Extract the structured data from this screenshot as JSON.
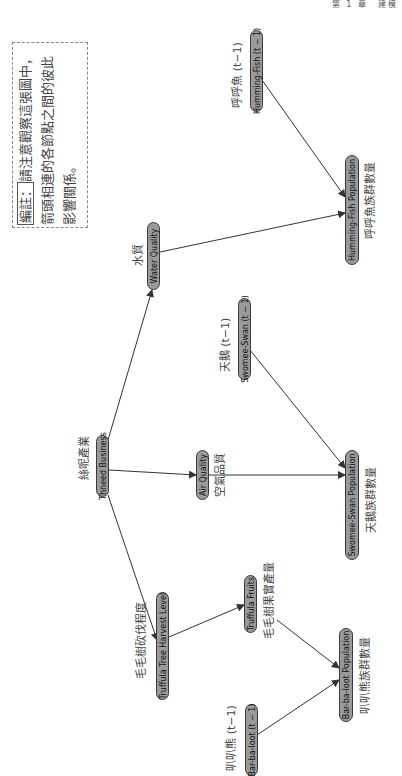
{
  "page_header": "第 1 章　建模",
  "note": {
    "tag": "編註：",
    "text": "請注意觀察這張圖中，箭頭相連的各節點之間的彼此影響關係。"
  },
  "nodes": {
    "humming_fish_prev": {
      "en": "Humming-Fish (t − 1)",
      "cn": "呼呼魚 (t−1)"
    },
    "humming_fish_pop": {
      "en": "Humming-Fish Population",
      "cn": "呼呼魚族群數量"
    },
    "water_quality": {
      "en": "Water Quality",
      "cn": "水質"
    },
    "swomee_swan_prev": {
      "en": "Swomee-Swan (t − 1)",
      "cn": "天鵝 (t−1)"
    },
    "thneed_business": {
      "en": "Thneed Business",
      "cn": "絲呢產業"
    },
    "air_quality": {
      "en": "Air Quality",
      "cn": "空氣品質"
    },
    "swomee_swan_pop": {
      "en": "Swomee-Swan Population",
      "cn": "天鵝族群數量"
    },
    "truffula_harvest": {
      "en": "Truffula Tree Harvest Level",
      "cn": "毛毛樹砍伐程度"
    },
    "truffula_fruits": {
      "en": "Truffula Fruits",
      "cn": "毛毛樹果實產量"
    },
    "barbaloot_pop": {
      "en": "Bar-ba-loot Population",
      "cn": "叭叭熊族群數量"
    },
    "barbaloot_prev": {
      "en": "Bar-ba-loot (t − 1)",
      "cn": "叭叭熊 (t−1)"
    }
  },
  "edges": [
    {
      "from": "thneed_business",
      "to": "water_quality"
    },
    {
      "from": "thneed_business",
      "to": "air_quality"
    },
    {
      "from": "thneed_business",
      "to": "truffula_harvest"
    },
    {
      "from": "water_quality",
      "to": "humming_fish_pop"
    },
    {
      "from": "humming_fish_prev",
      "to": "humming_fish_pop"
    },
    {
      "from": "air_quality",
      "to": "swomee_swan_pop"
    },
    {
      "from": "swomee_swan_prev",
      "to": "swomee_swan_pop"
    },
    {
      "from": "truffula_harvest",
      "to": "truffula_fruits"
    },
    {
      "from": "truffula_fruits",
      "to": "barbaloot_pop"
    },
    {
      "from": "barbaloot_prev",
      "to": "barbaloot_pop"
    }
  ],
  "colors": {
    "node_fill": "#9a9a9a",
    "node_border": "#3a3a3a",
    "edge": "#333333"
  }
}
